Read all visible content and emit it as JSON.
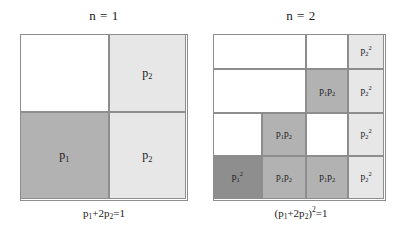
{
  "figure": {
    "background": "#ffffff",
    "stroke_color": "#8d8d8d",
    "colors": {
      "white": "#ffffff",
      "light_gray": "#e7e7e7",
      "medium_gray": "#b2b2b2",
      "dark_gray": "#8e8e8e"
    }
  },
  "panels": [
    {
      "id": "panel-n1",
      "title": "n = 1",
      "caption_html": "p<sub>1</sub>+2p<sub>2</sub>=1",
      "caption_text": "p1+2p2=1",
      "grid": {
        "columns": 2,
        "rows": 2,
        "col_fractions": [
          0.535,
          0.465
        ],
        "row_fractions": [
          0.473,
          0.527
        ]
      },
      "cells": [
        {
          "name": "cell-r1c1",
          "label_html": "",
          "label_text": "",
          "fill": "white",
          "row": 1,
          "col": 1
        },
        {
          "name": "cell-r1c2",
          "label_html": "p<sub>2</sub>",
          "label_text": "p2",
          "fill": "light",
          "row": 1,
          "col": 2
        },
        {
          "name": "cell-r2c1",
          "label_html": "p<sub>1</sub>",
          "label_text": "p1",
          "fill": "medium",
          "row": 2,
          "col": 1
        },
        {
          "name": "cell-r2c2",
          "label_html": "p<sub>2</sub>",
          "label_text": "p2",
          "fill": "light",
          "row": 2,
          "col": 2
        }
      ]
    },
    {
      "id": "panel-n2",
      "title": "n = 2",
      "caption_html": "(p<sub>1</sub>+2p<sub>2</sub>)<sup>2</sup>=1",
      "caption_text": "(p1+2p2)2=1",
      "grid": {
        "columns": 4,
        "rows": 4,
        "col_fractions": [
          0.285,
          0.26,
          0.245,
          0.21
        ],
        "row_fractions": [
          0.215,
          0.265,
          0.26,
          0.26
        ]
      },
      "cells": [
        {
          "name": "cell-r1c12",
          "label_html": "",
          "label_text": "",
          "fill": "white",
          "row": 1,
          "col": 1,
          "colspan": 2
        },
        {
          "name": "cell-r1c3",
          "label_html": "",
          "label_text": "",
          "fill": "white",
          "row": 1,
          "col": 3
        },
        {
          "name": "cell-r1c4",
          "label_html": "p<sub>2</sub><sup>2</sup>",
          "label_text": "p2^2",
          "fill": "light",
          "row": 1,
          "col": 4
        },
        {
          "name": "cell-r2c12",
          "label_html": "",
          "label_text": "",
          "fill": "white",
          "row": 2,
          "col": 1,
          "colspan": 2
        },
        {
          "name": "cell-r2c3",
          "label_html": "p<sub>1</sub>p<sub>2</sub>",
          "label_text": "p1p2",
          "fill": "medium",
          "row": 2,
          "col": 3
        },
        {
          "name": "cell-r2c4",
          "label_html": "p<sub>2</sub><sup>2</sup>",
          "label_text": "p2^2",
          "fill": "light",
          "row": 2,
          "col": 4
        },
        {
          "name": "cell-r3c1",
          "label_html": "",
          "label_text": "",
          "fill": "white",
          "row": 3,
          "col": 1
        },
        {
          "name": "cell-r3c2",
          "label_html": "p<sub>1</sub>p<sub>2</sub>",
          "label_text": "p1p2",
          "fill": "medium",
          "row": 3,
          "col": 2
        },
        {
          "name": "cell-r3c3",
          "label_html": "",
          "label_text": "",
          "fill": "white",
          "row": 3,
          "col": 3
        },
        {
          "name": "cell-r3c4",
          "label_html": "p<sub>2</sub><sup>2</sup>",
          "label_text": "p2^2",
          "fill": "light",
          "row": 3,
          "col": 4
        },
        {
          "name": "cell-r4c1",
          "label_html": "p<sub>1</sub><sup>2</sup>",
          "label_text": "p1^2",
          "fill": "dark",
          "row": 4,
          "col": 1
        },
        {
          "name": "cell-r4c2",
          "label_html": "p<sub>1</sub>p<sub>2</sub>",
          "label_text": "p1p2",
          "fill": "medium",
          "row": 4,
          "col": 2
        },
        {
          "name": "cell-r4c3",
          "label_html": "p<sub>1</sub>p<sub>2</sub>",
          "label_text": "p1p2",
          "fill": "medium",
          "row": 4,
          "col": 3
        },
        {
          "name": "cell-r4c4",
          "label_html": "p<sub>2</sub><sup>2</sup>",
          "label_text": "p2^2",
          "fill": "light",
          "row": 4,
          "col": 4
        }
      ]
    }
  ]
}
